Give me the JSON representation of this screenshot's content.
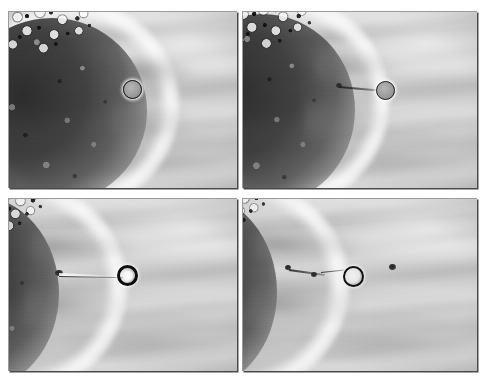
{
  "figure": {
    "panel_count": 4,
    "layout": "2x2 grid",
    "background_color": "#ffffff",
    "panel_border_color": "#4a4a4a",
    "image_tone": "grayscale"
  },
  "panels": [
    {
      "id": "panel-top-left",
      "position": "top-left",
      "sequence": 1,
      "cell_mass": {
        "label": "cumulus-oocyte cell mass",
        "size": "large",
        "edge_x_pct": 58
      },
      "bead": {
        "label": "bead",
        "style": "filled",
        "x_pct": 54,
        "y_pct": 44,
        "diameter_px": 19
      },
      "tether": {
        "visible": false,
        "length_px": 0
      },
      "specks": []
    },
    {
      "id": "panel-top-right",
      "position": "top-right",
      "sequence": 2,
      "cell_mass": {
        "label": "cumulus-oocyte cell mass",
        "size": "large",
        "edge_x_pct": 46
      },
      "bead": {
        "label": "bead",
        "style": "filled",
        "x_pct": 61,
        "y_pct": 45,
        "diameter_px": 19
      },
      "tether": {
        "visible": true,
        "length_px": 40
      },
      "specks": [
        {
          "x_pct": 40,
          "y_pct": 42,
          "d": 5
        }
      ]
    },
    {
      "id": "panel-bottom-left",
      "position": "bottom-left",
      "sequence": 3,
      "cell_mass": {
        "label": "cumulus-oocyte cell mass",
        "size": "small",
        "edge_x_pct": 22
      },
      "bead": {
        "label": "bead",
        "style": "ring-thick",
        "x_pct": 51,
        "y_pct": 45,
        "diameter_px": 21
      },
      "tether": {
        "visible": true,
        "length_px": 78
      },
      "specks": [
        {
          "x_pct": 22,
          "y_pct": 42,
          "d": 6
        }
      ]
    },
    {
      "id": "panel-bottom-right",
      "position": "bottom-right",
      "sequence": 4,
      "cell_mass": {
        "label": "cumulus-oocyte cell mass",
        "size": "small",
        "edge_x_pct": 16
      },
      "bead": {
        "label": "bead",
        "style": "ring",
        "x_pct": 50,
        "y_pct": 44,
        "diameter_px": 21
      },
      "tether": {
        "visible": true,
        "length_px": 74
      },
      "specks": [
        {
          "x_pct": 19,
          "y_pct": 40,
          "d": 5
        },
        {
          "x_pct": 30,
          "y_pct": 44,
          "d": 5
        },
        {
          "x_pct": 63,
          "y_pct": 40,
          "d": 6
        }
      ]
    }
  ]
}
